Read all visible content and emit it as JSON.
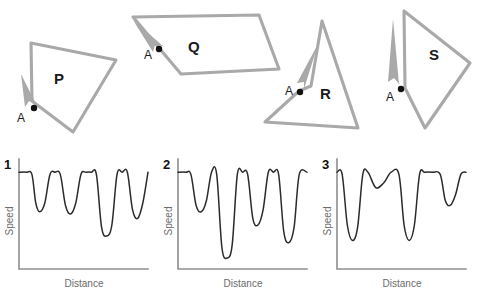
{
  "figure": {
    "title": "",
    "shapes_row": {
      "shapes": [
        {
          "id": "P",
          "label": "P",
          "start_label": "A",
          "label_x": 54,
          "label_y": 84,
          "start_label_x": 17,
          "start_label_y": 122,
          "dot_x": 34,
          "dot_y": 108,
          "outline": "M 31,43 L 116,60 L 73,132 L 32,101 Z",
          "arrow": "M 21,74 L 36,104 L 29,101 L 25,107 Z",
          "arrow_rotation": 0,
          "corner_count": 4,
          "direction": "counter-clockwise"
        },
        {
          "id": "Q",
          "label": "Q",
          "start_label": "A",
          "start_label_x": 144,
          "start_label_y": 59,
          "label_x": 188,
          "label_y": 52,
          "dot_x": 159,
          "dot_y": 49,
          "outline": "M 133,17 L 259,15 L 279,69 L 181,74 Z",
          "arrow": "M 133,20 L 163,46 L 155,45 L 153,52 Z",
          "arrow_rotation": 0,
          "corner_count": 4,
          "direction": "counter-clockwise"
        },
        {
          "id": "R",
          "label": "R",
          "start_label": "A",
          "start_label_x": 285,
          "start_label_y": 95,
          "label_x": 320,
          "label_y": 99,
          "dot_x": 300,
          "dot_y": 92,
          "outline": "M 322,21 L 358,128 L 265,122 L 299,91 L 311,86 Z",
          "arrow": "M 318,44 L 304,89 L 304,82 L 297,83 Z",
          "arrow_rotation": 0,
          "corner_count": 4,
          "direction": "counter-clockwise"
        },
        {
          "id": "S",
          "label": "S",
          "start_label": "A",
          "start_label_x": 386,
          "start_label_y": 101,
          "label_x": 429,
          "label_y": 60,
          "dot_x": 401,
          "dot_y": 89,
          "outline": "M 405,88 L 425,128 L 470,63 L 404,11 Z",
          "arrow": "M 393,19 L 399,84 L 394,78 L 388,82 Z",
          "arrow_rotation": 0,
          "corner_count": 4,
          "direction": "clockwise"
        }
      ]
    },
    "graphs": [
      {
        "number": "1",
        "ylabel": "Speed",
        "xlabel": "Distance",
        "chart_data": {
          "type": "line",
          "title": "1",
          "xlabel": "Distance",
          "ylabel": "Speed",
          "xlim": [
            0,
            100
          ],
          "ylim": [
            0,
            100
          ],
          "grid": false,
          "legend": "none",
          "series": [
            {
              "name": "speed-vs-distance-1",
              "x": [
                0,
                6,
                10,
                13,
                16,
                20,
                24,
                28,
                32,
                36,
                40,
                44,
                48,
                52,
                56,
                60,
                64,
                68,
                72,
                76,
                80,
                84,
                88,
                92,
                96,
                100
              ],
              "y": [
                88,
                88,
                86,
                60,
                52,
                60,
                86,
                88,
                86,
                58,
                50,
                60,
                86,
                88,
                88,
                86,
                38,
                30,
                40,
                86,
                88,
                88,
                54,
                46,
                60,
                88
              ]
            }
          ],
          "dip_count": 4,
          "dip_depths": [
            "shallow",
            "shallow",
            "deep",
            "medium"
          ],
          "dip_positions_pct": [
            15,
            38,
            66,
            88
          ]
        }
      },
      {
        "number": "2",
        "ylabel": "Speed",
        "xlabel": "Distance",
        "chart_data": {
          "type": "line",
          "title": "2",
          "xlabel": "Distance",
          "ylabel": "Speed",
          "xlim": [
            0,
            100
          ],
          "ylim": [
            0,
            100
          ],
          "grid": false,
          "legend": "none",
          "series": [
            {
              "name": "speed-vs-distance-2",
              "x": [
                0,
                6,
                10,
                14,
                18,
                22,
                26,
                30,
                34,
                38,
                42,
                46,
                50,
                54,
                58,
                62,
                66,
                70,
                74,
                78,
                82,
                86,
                90,
                94,
                100
              ],
              "y": [
                88,
                88,
                86,
                58,
                52,
                62,
                88,
                86,
                20,
                10,
                22,
                86,
                88,
                86,
                46,
                40,
                54,
                88,
                88,
                86,
                34,
                24,
                38,
                86,
                88
              ]
            }
          ],
          "dip_count": 4,
          "dip_depths": [
            "shallow",
            "very-deep",
            "medium",
            "deep"
          ],
          "dip_positions_pct": [
            15,
            38,
            60,
            85
          ]
        }
      },
      {
        "number": "3",
        "ylabel": "Speed",
        "xlabel": "Distance",
        "chart_data": {
          "type": "line",
          "title": "3",
          "xlabel": "Distance",
          "ylabel": "Speed",
          "xlim": [
            0,
            100
          ],
          "ylim": [
            0,
            100
          ],
          "grid": false,
          "legend": "none",
          "series": [
            {
              "name": "speed-vs-distance-3",
              "x": [
                0,
                4,
                8,
                12,
                16,
                20,
                24,
                30,
                36,
                42,
                48,
                52,
                56,
                60,
                64,
                68,
                74,
                80,
                84,
                88,
                92,
                96,
                100
              ],
              "y": [
                88,
                86,
                40,
                26,
                38,
                86,
                88,
                74,
                78,
                88,
                86,
                40,
                26,
                40,
                86,
                88,
                88,
                86,
                62,
                58,
                68,
                86,
                88
              ]
            }
          ],
          "dip_count": 4,
          "dip_depths": [
            "deep",
            "very-shallow",
            "deep",
            "shallow"
          ],
          "dip_positions_pct": [
            10,
            33,
            55,
            86
          ]
        }
      }
    ]
  },
  "colors": {
    "shape_stroke": "#a9a9a9",
    "curve_stroke": "#2b2b2b",
    "axis_stroke": "#8e8e8e",
    "text": "#111111",
    "axis_label_text": "#6b6b6b",
    "background": "#ffffff"
  }
}
